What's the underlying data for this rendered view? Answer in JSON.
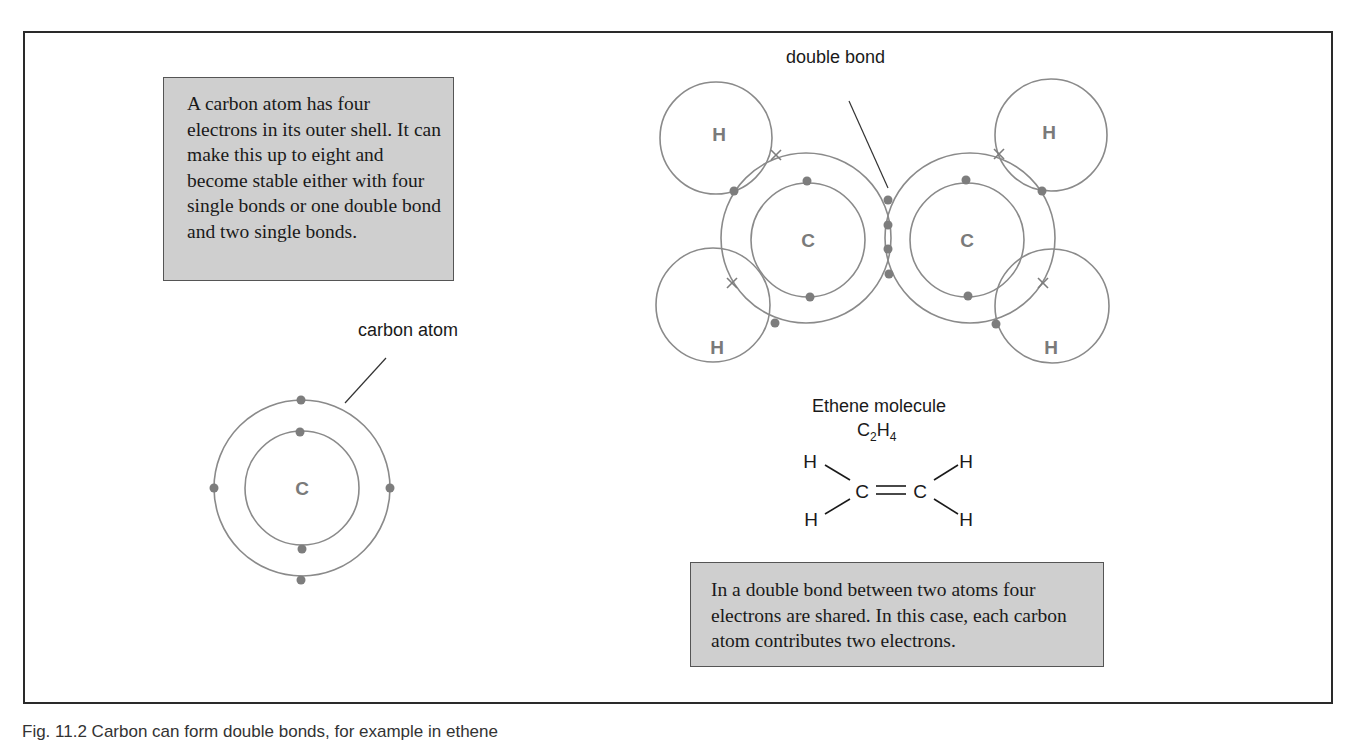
{
  "figure": {
    "caption": "Fig. 11.2   Carbon can form double bonds, for example in ethene"
  },
  "notes": {
    "carbon_shell": "A carbon atom has four electrons in its outer shell. It can make this up to eight and become stable either with four single bonds or one double bond and two single bonds.",
    "double_bond_sharing": "In a double bond between two atoms four electrons are shared. In this case, each carbon atom contributes two electrons."
  },
  "labels": {
    "carbon_atom": "carbon atom",
    "double_bond": "double bond",
    "molecule_name": "Ethene molecule",
    "formula": {
      "c": "C",
      "c_sub": "2",
      "h": "H",
      "h_sub": "4"
    }
  },
  "atoms": {
    "carbon_single": {
      "symbol": "C",
      "inner_electrons": 2,
      "outer_electrons": 4
    },
    "ethene": {
      "carbon_left": {
        "symbol": "C"
      },
      "carbon_right": {
        "symbol": "C"
      },
      "hydrogen_top_left": {
        "symbol": "H"
      },
      "hydrogen_bottom_left": {
        "symbol": "H"
      },
      "hydrogen_top_right": {
        "symbol": "H"
      },
      "hydrogen_bottom_right": {
        "symbol": "H"
      },
      "shared_electrons_in_double_bond": 4
    }
  },
  "structural_formula": {
    "h_top_left": "H",
    "h_bottom_left": "H",
    "c_left": "C",
    "c_right": "C",
    "h_top_right": "H",
    "h_bottom_right": "H",
    "bond": "="
  },
  "colors": {
    "shell_stroke": "#8a8a8a",
    "electron_fill": "#7d7d7d",
    "note_background": "#cfcfcf",
    "frame_border": "#2a2a2a"
  }
}
